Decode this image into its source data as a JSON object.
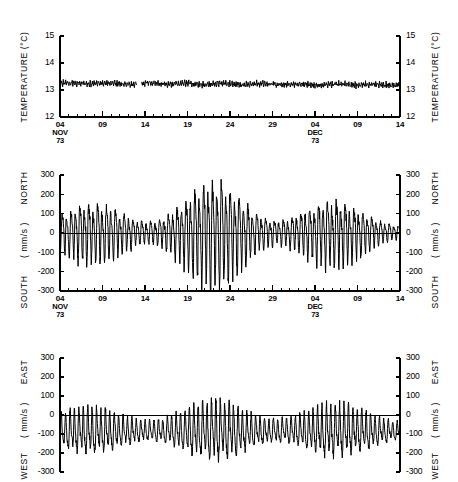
{
  "figure": {
    "panels": [
      {
        "id": "temperature",
        "axis_label_left": "TEMPERATURE (°C)",
        "axis_label_right": "TEMPERATURE (°C)",
        "yticks": [
          15,
          14,
          13,
          12
        ],
        "ytick_labels": [
          "15",
          "14",
          "13",
          "12"
        ],
        "ylim": [
          12,
          15
        ],
        "units": "°C",
        "upper_label": "",
        "lower_label": "",
        "zero_line": false
      },
      {
        "id": "north-south",
        "axis_label_left_top": "NORTH",
        "axis_label_left_mid": "( mm/s )",
        "axis_label_left_bottom": "SOUTH",
        "axis_label_right_top": "NORTH",
        "axis_label_right_mid": "( mm/s )",
        "axis_label_right_bottom": "SOUTH",
        "yticks": [
          300,
          200,
          100,
          0,
          -100,
          -200,
          -300
        ],
        "ytick_labels": [
          "300",
          "200",
          "100",
          "0",
          "-100",
          "-200",
          "-300"
        ],
        "ylim": [
          -300,
          300
        ],
        "units": "mm/s",
        "zero_line": true
      },
      {
        "id": "east-west",
        "axis_label_left_top": "EAST",
        "axis_label_left_mid": "( mm/s )",
        "axis_label_left_bottom": "WEST",
        "axis_label_right_top": "EAST",
        "axis_label_right_mid": "( mm/s )",
        "axis_label_right_bottom": "WEST",
        "yticks": [
          300,
          200,
          100,
          0,
          -100,
          -200,
          -300
        ],
        "ytick_labels": [
          "300",
          "200",
          "100",
          "0",
          "-100",
          "-200",
          "-300"
        ],
        "ylim": [
          -300,
          300
        ],
        "units": "mm/s",
        "zero_line": true
      }
    ],
    "xaxis": {
      "major_ticks": [
        {
          "day": 4,
          "label": "04",
          "sub1": "NOV",
          "sub2": "73"
        },
        {
          "day": 9,
          "label": "09",
          "sub1": "",
          "sub2": ""
        },
        {
          "day": 14,
          "label": "14",
          "sub1": "",
          "sub2": ""
        },
        {
          "day": 19,
          "label": "19",
          "sub1": "",
          "sub2": ""
        },
        {
          "day": 24,
          "label": "24",
          "sub1": "",
          "sub2": ""
        },
        {
          "day": 29,
          "label": "29",
          "sub1": "",
          "sub2": ""
        },
        {
          "day": 34,
          "label": "04",
          "sub1": "DEC",
          "sub2": "73"
        },
        {
          "day": 39,
          "label": "09",
          "sub1": "",
          "sub2": ""
        },
        {
          "day": 44,
          "label": "14",
          "sub1": "",
          "sub2": ""
        }
      ],
      "minor_tick_interval_days": 1,
      "range_days": [
        4,
        44
      ],
      "start_label": "04 NOV 73",
      "end_label": "14 DEC 73"
    }
  },
  "chart_data": {
    "type": "line",
    "title": "",
    "subtitle": "",
    "xlabel": "",
    "ylabel": "",
    "grid": false,
    "legend": "none",
    "x_units": "days",
    "x": [
      4,
      44
    ],
    "series": [
      {
        "name": "TEMPERATURE (°C)",
        "panel": "temperature",
        "ylabel": "TEMPERATURE (°C)",
        "ylim": [
          12,
          15
        ],
        "yticks": [
          12,
          13,
          14,
          15
        ],
        "mean": 13.25,
        "noise_amplitude": 0.12,
        "trend_per_day": -0.0015,
        "gap_days": [
          13.0,
          13.6
        ],
        "description": "Near-constant temperature oscillating about 13.2-13.4 C with small high-frequency fluctuations and a brief data gap near 13 Nov."
      },
      {
        "name": "NORTH-SOUTH CURRENT",
        "panel": "north-south",
        "ylabel": "( mm/s )",
        "ylim": [
          -300,
          300
        ],
        "yticks": [
          -300,
          -200,
          -100,
          0,
          100,
          200,
          300
        ],
        "mean": 5,
        "tidal_period_days": 0.52,
        "envelope_min": 45,
        "envelope_max": 175,
        "spring_neap_period_days": 14.8,
        "description": "Semidiurnal tidal oscillation about zero; amplitude grows from ~50 mm/s in early November to ~200 mm/s near 20-24 Nov, then decays toward mid December."
      },
      {
        "name": "EAST-WEST CURRENT",
        "panel": "east-west",
        "ylabel": "( mm/s )",
        "ylim": [
          -300,
          300
        ],
        "yticks": [
          -300,
          -200,
          -100,
          0,
          100,
          200,
          300
        ],
        "mean": -85,
        "tidal_period_days": 0.52,
        "envelope_min": 45,
        "envelope_max": 115,
        "spring_neap_period_days": 14.8,
        "description": "Semidiurnal oscillation superimposed on a steady westward mean flow of about -85 mm/s; peaks occasionally reach zero, troughs reach about -220 mm/s."
      }
    ]
  }
}
